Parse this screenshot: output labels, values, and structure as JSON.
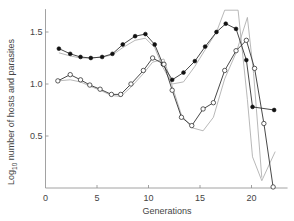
{
  "chart_data": {
    "type": "line",
    "title": "",
    "xlabel": "Generations",
    "ylabel": "Log10 number of hosts and parasites",
    "ylabel_parts": {
      "prefix": "Log",
      "subscript": "10",
      "suffix": " number of hosts and parasites"
    },
    "xlim": [
      0,
      23.5
    ],
    "ylim": [
      0,
      1.72
    ],
    "xticks": [
      0,
      5,
      10,
      15,
      20
    ],
    "xtick_labels": [
      "0",
      "5",
      "10",
      "15",
      "20"
    ],
    "yticks": [
      0.5,
      1.0,
      1.5
    ],
    "ytick_labels": [
      "0.5",
      "1.0",
      "1.5"
    ],
    "grid": false,
    "legend": "none",
    "series": [
      {
        "name": "Hosts (observed)",
        "marker": "filled-circle",
        "color": "#111111",
        "x": [
          1.3,
          2.4,
          3.4,
          4.4,
          5.5,
          6.5,
          7.5,
          8.7,
          9.7,
          10.6,
          11.4,
          12.3,
          13.4,
          14.5,
          15.5,
          16.6,
          17.5,
          18.5,
          19.5,
          20.1,
          22.2
        ],
        "values": [
          1.34,
          1.29,
          1.26,
          1.25,
          1.26,
          1.29,
          1.38,
          1.46,
          1.48,
          1.38,
          1.19,
          1.04,
          1.11,
          1.22,
          1.36,
          1.5,
          1.58,
          1.53,
          1.23,
          0.78,
          0.75
        ]
      },
      {
        "name": "Parasites (observed)",
        "marker": "open-circle",
        "color": "#333333",
        "x": [
          1.2,
          2.4,
          3.4,
          4.3,
          5.3,
          6.4,
          7.3,
          8.3,
          9.5,
          10.4,
          11.5,
          12.3,
          13.2,
          14.2,
          15.3,
          16.3,
          17.4,
          18.5,
          19.5,
          20.3,
          21.2,
          22.1
        ],
        "values": [
          1.03,
          1.09,
          1.04,
          0.99,
          0.95,
          0.9,
          0.9,
          1.0,
          1.13,
          1.25,
          1.19,
          0.94,
          0.68,
          0.6,
          0.76,
          0.82,
          1.13,
          1.32,
          1.42,
          1.15,
          0.62,
          0.01
        ]
      },
      {
        "name": "Hosts (model)",
        "marker": "none",
        "color": "#b0b0b0",
        "x": [
          1.3,
          2.4,
          3.4,
          4.4,
          5.5,
          6.5,
          7.5,
          8.7,
          9.7,
          10.6,
          11.4,
          12.3,
          13.4,
          14.5,
          15.5,
          16.6,
          17.4,
          18.7,
          19.6,
          20.1,
          21.0,
          22.3
        ],
        "values": [
          1.3,
          1.27,
          1.25,
          1.25,
          1.26,
          1.28,
          1.35,
          1.42,
          1.44,
          1.35,
          1.16,
          1.0,
          1.02,
          1.17,
          1.33,
          1.5,
          1.71,
          1.71,
          0.85,
          0.3,
          0.07,
          0.35
        ]
      },
      {
        "name": "Parasites (model)",
        "marker": "none",
        "color": "#b0b0b0",
        "x": [
          1.2,
          2.4,
          3.4,
          4.3,
          5.3,
          6.4,
          7.3,
          8.3,
          9.5,
          10.4,
          11.5,
          12.3,
          13.2,
          14.2,
          15.3,
          16.3,
          17.4,
          18.5,
          19.6,
          20.2,
          21.0
        ],
        "values": [
          1.03,
          1.04,
          1.02,
          0.98,
          0.94,
          0.89,
          0.88,
          0.97,
          1.1,
          1.21,
          1.24,
          0.98,
          0.7,
          0.58,
          0.55,
          0.68,
          1.05,
          1.3,
          1.64,
          1.1,
          0.1
        ]
      }
    ]
  }
}
